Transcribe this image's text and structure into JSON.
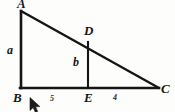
{
  "figure": {
    "type": "geometry-diagram",
    "background_color": "#fdfdfc",
    "stroke_color": "#151515",
    "labels": {
      "vertex_a": "A",
      "vertex_b": "B",
      "vertex_c": "C",
      "vertex_d": "D",
      "vertex_e": "E",
      "side_ab": "a",
      "side_de": "b",
      "measure_be": "5",
      "measure_ec": "4"
    },
    "points": {
      "A": {
        "x": 21,
        "y": 11
      },
      "B": {
        "x": 21,
        "y": 88
      },
      "C": {
        "x": 159,
        "y": 88
      },
      "D": {
        "x": 88,
        "y": 42
      },
      "E": {
        "x": 88,
        "y": 88
      }
    },
    "segments": [
      {
        "name": "AB",
        "from": "A",
        "to": "B"
      },
      {
        "name": "BC",
        "from": "B",
        "to": "C"
      },
      {
        "name": "AC",
        "from": "A",
        "to": "C"
      },
      {
        "name": "DE",
        "from": "D",
        "to": "E"
      }
    ]
  },
  "cursor": {
    "icon": "mouse-pointer-arrow",
    "x": 29,
    "y": 97
  }
}
